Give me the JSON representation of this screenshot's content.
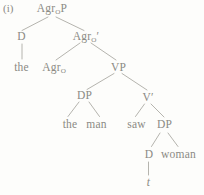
{
  "figure": {
    "index_label": "(i)",
    "type": "syntax-tree",
    "colors": {
      "text": "#8b8a84",
      "line": "#b5b4ae",
      "background": "#fdfdfb"
    },
    "tree": {
      "nodes": {
        "agr_o_p": {
          "pre": "Agr",
          "sub": "O",
          "post": "P"
        },
        "d_spec": {
          "label": "D"
        },
        "agr_o_bar": {
          "pre": "Agr",
          "sub": "O",
          "post": "′"
        },
        "the_spec": {
          "label": "the"
        },
        "agr_o_head": {
          "pre": "Agr",
          "sub": "O",
          "post": ""
        },
        "vp": {
          "label": "VP"
        },
        "dp_subject": {
          "label": "DP"
        },
        "v_bar": {
          "label": "V′"
        },
        "the_subject": {
          "label": "the"
        },
        "man": {
          "label": "man"
        },
        "saw": {
          "label": "saw"
        },
        "dp_object": {
          "label": "DP"
        },
        "d_object": {
          "label": "D"
        },
        "woman": {
          "label": "woman"
        },
        "trace": {
          "label": "t"
        }
      }
    }
  }
}
